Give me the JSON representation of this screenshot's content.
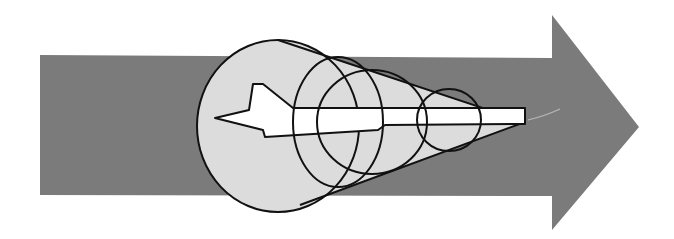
{
  "diagram": {
    "colors": {
      "background": "#ffffff",
      "arrow": "#7b7b7b",
      "cone_fill": "#dcdcdc",
      "plane_fill": "#ffffff",
      "stroke": "#111111"
    },
    "elements": [
      "arrow",
      "cone",
      "large-circle",
      "middle-ellipse",
      "inner-arc",
      "small-circle",
      "aircraft"
    ]
  }
}
